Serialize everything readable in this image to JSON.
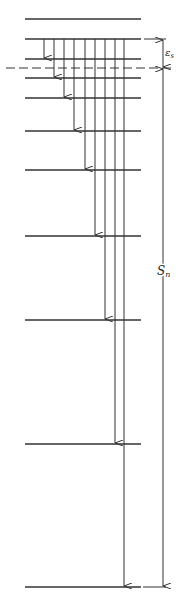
{
  "diagram": {
    "colors": {
      "line": "#333333",
      "background": "#ffffff"
    },
    "levels_x": [
      25,
      141
    ],
    "levels_y": [
      19,
      39,
      59,
      78,
      98,
      131,
      170,
      236,
      320,
      444,
      587
    ],
    "series_limit_y": 68,
    "transitions": [
      {
        "x": 44,
        "from_y": 39,
        "to_y": 59
      },
      {
        "x": 54,
        "from_y": 39,
        "to_y": 78
      },
      {
        "x": 64,
        "from_y": 39,
        "to_y": 98
      },
      {
        "x": 74,
        "from_y": 39,
        "to_y": 131
      },
      {
        "x": 85,
        "from_y": 39,
        "to_y": 170
      },
      {
        "x": 95,
        "from_y": 39,
        "to_y": 236
      },
      {
        "x": 105,
        "from_y": 39,
        "to_y": 320
      },
      {
        "x": 115,
        "from_y": 39,
        "to_y": 444
      },
      {
        "x": 124,
        "from_y": 39,
        "to_y": 587
      }
    ],
    "dimension_x": 163,
    "labels": {
      "epsilon": "ε",
      "epsilon_sub": "s",
      "s": "S",
      "s_sub": "n"
    }
  }
}
